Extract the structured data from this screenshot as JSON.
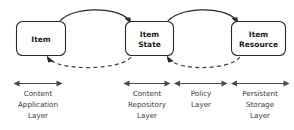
{
  "diagram": {
    "background_color": "#ffffff",
    "stroke_color": "#2b2b2b",
    "nodes": [
      {
        "id": "item",
        "label_line1": "Item",
        "label_line2": ""
      },
      {
        "id": "item-state",
        "label_line1": "Item",
        "label_line2": "State"
      },
      {
        "id": "item-resource",
        "label_line1": "Item",
        "label_line2": "Resource"
      }
    ],
    "edges": [
      {
        "id": "item-to-item-state",
        "style": "solid",
        "direction": "right",
        "from": "item",
        "to": "item-state"
      },
      {
        "id": "item-state-to-item-resource",
        "style": "solid",
        "direction": "right",
        "from": "item-state",
        "to": "item-resource"
      },
      {
        "id": "item-state-to-item",
        "style": "dashed",
        "direction": "left",
        "from": "item-state",
        "to": "item"
      },
      {
        "id": "item-resource-to-item-state",
        "style": "dashed",
        "direction": "left",
        "from": "item-resource",
        "to": "item-state"
      }
    ],
    "layers": [
      {
        "id": "content-application-layer",
        "lines": [
          "Content",
          "Application",
          "Layer"
        ]
      },
      {
        "id": "content-repository-layer",
        "lines": [
          "Content",
          "Repository",
          "Layer"
        ]
      },
      {
        "id": "policy-layer",
        "lines": [
          "Policy",
          "Layer"
        ]
      },
      {
        "id": "persistent-storage-layer",
        "lines": [
          "Persistent",
          "Storage",
          "Layer"
        ]
      }
    ]
  }
}
